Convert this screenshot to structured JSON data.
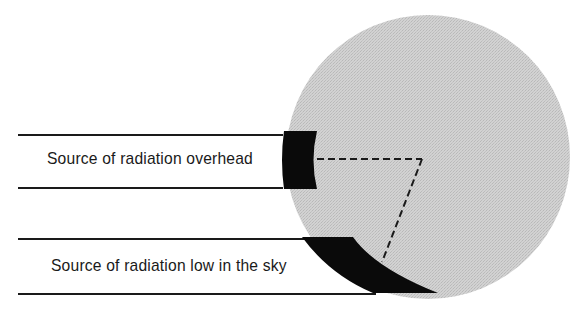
{
  "diagram": {
    "type": "radiation-incidence-on-sphere",
    "colors": {
      "background": "#ffffff",
      "sphere_fill": "#cfcfcf",
      "sphere_texture": "#bdbdbd",
      "beam_lines": "#1a1a1a",
      "shadow_band": "#0a0a0a",
      "dashed_lines": "#1a1a1a",
      "text": "#1a1a1a"
    },
    "sphere": {
      "cx": 428,
      "cy": 157,
      "r": 142
    },
    "beams": [
      {
        "id": "overhead",
        "label": "Source of radiation overhead",
        "upper_line_y": 135,
        "lower_line_y": 188,
        "line_start_x": 18,
        "line_end_x": 282
      },
      {
        "id": "low",
        "label": "Source of radiation low in the sky",
        "upper_line_y": 239,
        "lower_line_y": 294,
        "line_start_x": 18,
        "line_end_x": 373
      }
    ],
    "dashed_lines": [
      {
        "from": [
          317,
          159
        ],
        "to": [
          422,
          159
        ]
      },
      {
        "from": [
          422,
          159
        ],
        "to": [
          382,
          262
        ]
      }
    ]
  }
}
